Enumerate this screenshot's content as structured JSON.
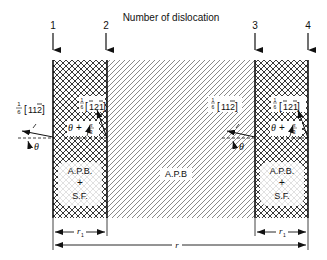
{
  "title": "Number of dislocation",
  "dislocations": [
    {
      "number": "1",
      "x": 53
    },
    {
      "number": "2",
      "x": 107
    },
    {
      "number": "3",
      "x": 255
    },
    {
      "number": "4",
      "x": 308
    }
  ],
  "regions": [
    {
      "name": "left-fault",
      "pattern": "crosshatch",
      "label_line1": "A.P.B.",
      "label_plus": "+",
      "label_line2": "S.F."
    },
    {
      "name": "center",
      "pattern": "diagonal-hatch",
      "label": "A.P.B"
    },
    {
      "name": "right-fault",
      "pattern": "crosshatch",
      "label_line1": "A.P.B.",
      "label_plus": "+",
      "label_line2": "S.F."
    }
  ],
  "burgers_vectors": {
    "left_outer": {
      "frac_num": "1",
      "frac_den": "6",
      "vector": "[11̅2]"
    },
    "left_inner": {
      "frac_num": "1",
      "frac_den": "6",
      "vector": "[̅2 1̅]"
    },
    "right_outer": {
      "frac_num": "1",
      "frac_den": "6",
      "vector": "[11̅2]"
    },
    "right_inner": {
      "frac_num": "1",
      "frac_den": "6",
      "vector": "[̅1 2 1̅]"
    }
  },
  "burgers_text": {
    "left_outer": "[112̅]",
    "left_inner": "[1̅21̅]",
    "right_outer": "[112̅]",
    "right_inner": "[1̅21̅]"
  },
  "angles": {
    "theta": "θ",
    "theta_plus": "θ + ",
    "pi": "π",
    "three": "3"
  },
  "dimensions": {
    "r1_left": "r₁",
    "r1_right": "r₁",
    "r": "r"
  }
}
